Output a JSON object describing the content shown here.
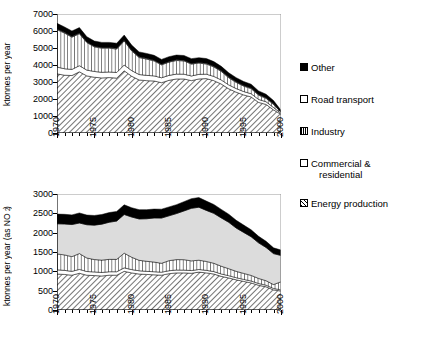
{
  "chart_data": [
    {
      "id": "top",
      "type": "area",
      "stacked": true,
      "title": "",
      "xlabel": "",
      "ylabel": "ktonnes per year",
      "xlim": [
        1970,
        2000
      ],
      "ylim": [
        0,
        7000
      ],
      "yticks": [
        0,
        1000,
        2000,
        3000,
        4000,
        5000,
        6000,
        7000
      ],
      "xticks": [
        1970,
        1975,
        1980,
        1985,
        1990,
        1995,
        2000
      ],
      "xtick_labels": [
        "1970",
        "1975",
        "1980",
        "1985",
        "1990",
        "1995",
        "2000"
      ],
      "grid": false,
      "x": [
        1970,
        1971,
        1972,
        1973,
        1974,
        1975,
        1976,
        1977,
        1978,
        1979,
        1980,
        1981,
        1982,
        1983,
        1984,
        1985,
        1986,
        1987,
        1988,
        1989,
        1990,
        1991,
        1992,
        1993,
        1994,
        1995,
        1996,
        1997,
        1998,
        1999,
        2000
      ],
      "series": [
        {
          "name": "Energy production",
          "pattern": "diagonal-hatch",
          "values": [
            3480,
            3400,
            3380,
            3600,
            3360,
            3280,
            3240,
            3260,
            3230,
            3660,
            3340,
            3120,
            3080,
            3060,
            2960,
            3100,
            3180,
            3180,
            3080,
            3180,
            3200,
            3080,
            2880,
            2600,
            2400,
            2240,
            2120,
            1800,
            1680,
            1360,
            1100
          ]
        },
        {
          "name": "Commercial & residential",
          "pattern": "white",
          "values": [
            400,
            380,
            360,
            360,
            340,
            340,
            330,
            330,
            330,
            340,
            330,
            320,
            310,
            300,
            290,
            290,
            285,
            280,
            275,
            270,
            260,
            250,
            240,
            230,
            215,
            200,
            190,
            175,
            160,
            140,
            60
          ]
        },
        {
          "name": "Industry",
          "pattern": "vertical-hatch",
          "values": [
            2200,
            2100,
            1900,
            1880,
            1620,
            1450,
            1420,
            1400,
            1380,
            1420,
            1160,
            1000,
            960,
            880,
            760,
            780,
            800,
            780,
            700,
            660,
            600,
            560,
            500,
            420,
            360,
            320,
            300,
            250,
            200,
            180,
            60
          ]
        },
        {
          "name": "Road transport",
          "pattern": "white",
          "values": [
            40,
            40,
            40,
            40,
            40,
            40,
            40,
            40,
            40,
            40,
            40,
            40,
            40,
            40,
            40,
            40,
            40,
            40,
            40,
            40,
            40,
            40,
            40,
            40,
            40,
            40,
            40,
            40,
            40,
            40,
            20
          ]
        },
        {
          "name": "Other",
          "pattern": "black",
          "values": [
            330,
            320,
            320,
            320,
            300,
            300,
            300,
            300,
            300,
            300,
            300,
            290,
            290,
            290,
            280,
            280,
            280,
            280,
            280,
            280,
            280,
            270,
            260,
            250,
            240,
            230,
            220,
            210,
            200,
            190,
            100
          ]
        }
      ],
      "totals": [
        6450,
        6240,
        6000,
        6200,
        5660,
        5410,
        5330,
        5330,
        5280,
        5760,
        5170,
        4770,
        4680,
        4530,
        4330,
        4490,
        4585,
        4520,
        4375,
        4390,
        4380,
        4200,
        3920,
        3540,
        3255,
        3030,
        2870,
        2475,
        2280,
        1910,
        1340
      ]
    },
    {
      "id": "bottom",
      "type": "area",
      "stacked": true,
      "title": "",
      "xlabel": "",
      "ylabel": "ktonnes per year (as NO2)",
      "ylabel_html": "ktonnes per year (as NO<sub>2</sub>)",
      "xlim": [
        1970,
        2000
      ],
      "ylim": [
        0,
        3000
      ],
      "yticks": [
        0,
        500,
        1000,
        1500,
        2000,
        2500,
        3000
      ],
      "xticks": [
        1970,
        1975,
        1980,
        1985,
        1990,
        1995,
        2000
      ],
      "xtick_labels": [
        "1970",
        "1975",
        "1980",
        "1985",
        "1990",
        "1995",
        "2000"
      ],
      "grid": false,
      "x": [
        1970,
        1971,
        1972,
        1973,
        1974,
        1975,
        1976,
        1977,
        1978,
        1979,
        1980,
        1981,
        1982,
        1983,
        1984,
        1985,
        1986,
        1987,
        1988,
        1989,
        1990,
        1991,
        1992,
        1993,
        1994,
        1995,
        1996,
        1997,
        1998,
        1999,
        2000
      ],
      "series": [
        {
          "name": "Energy production",
          "pattern": "diagonal-hatch",
          "values": [
            930,
            920,
            900,
            950,
            900,
            890,
            880,
            900,
            900,
            1000,
            960,
            930,
            920,
            910,
            900,
            940,
            960,
            960,
            950,
            980,
            960,
            930,
            870,
            830,
            780,
            740,
            700,
            640,
            600,
            520,
            490
          ]
        },
        {
          "name": "Commercial & residential",
          "pattern": "white",
          "values": [
            110,
            105,
            100,
            100,
            95,
            95,
            90,
            90,
            90,
            90,
            85,
            85,
            80,
            80,
            78,
            76,
            74,
            72,
            70,
            68,
            66,
            64,
            62,
            58,
            55,
            52,
            50,
            46,
            42,
            38,
            30
          ]
        },
        {
          "name": "Industry",
          "pattern": "vertical-hatch",
          "values": [
            410,
            400,
            380,
            410,
            350,
            320,
            320,
            320,
            320,
            380,
            320,
            270,
            260,
            250,
            230,
            260,
            270,
            270,
            250,
            240,
            230,
            215,
            200,
            180,
            165,
            155,
            145,
            130,
            115,
            100,
            210
          ]
        },
        {
          "name": "Road transport",
          "pattern": "light-gray",
          "values": [
            780,
            800,
            830,
            790,
            860,
            890,
            930,
            960,
            990,
            1000,
            1040,
            1070,
            1100,
            1140,
            1170,
            1160,
            1190,
            1260,
            1360,
            1370,
            1320,
            1290,
            1250,
            1200,
            1120,
            1060,
            1000,
            920,
            860,
            800,
            680
          ]
        },
        {
          "name": "Other",
          "pattern": "black",
          "values": [
            250,
            250,
            250,
            260,
            250,
            250,
            250,
            250,
            250,
            250,
            240,
            240,
            235,
            230,
            230,
            230,
            230,
            240,
            250,
            250,
            240,
            230,
            220,
            210,
            200,
            190,
            180,
            170,
            160,
            150,
            140
          ]
        }
      ],
      "totals": [
        2480,
        2475,
        2460,
        2510,
        2455,
        2445,
        2470,
        2520,
        2550,
        2720,
        2645,
        2595,
        2595,
        2610,
        2608,
        2666,
        2724,
        2802,
        2880,
        2908,
        2816,
        2729,
        2602,
        2478,
        2320,
        2197,
        2075,
        1906,
        1777,
        1608,
        1550
      ]
    }
  ],
  "legend": {
    "position": "right",
    "items": [
      {
        "label": "Other",
        "pattern": "black"
      },
      {
        "label": "Road transport",
        "pattern": "light-gray"
      },
      {
        "label": "Industry",
        "pattern": "vertical-hatch"
      },
      {
        "label": "Commercial & residential",
        "pattern": "white"
      },
      {
        "label": "Energy production",
        "pattern": "diagonal-hatch"
      }
    ],
    "item_labels": {
      "other": "Other",
      "road_transport": "Road transport",
      "industry": "Industry",
      "commercial_residential_line1": "Commercial &",
      "commercial_residential_line2": "residential",
      "energy_production": "Energy production"
    }
  },
  "axes_text": {
    "top_ylabel": "ktonnes per year",
    "bottom_ylabel_prefix": "ktonnes per year (as NO",
    "bottom_ylabel_sub": "2",
    "bottom_ylabel_suffix": ")"
  }
}
